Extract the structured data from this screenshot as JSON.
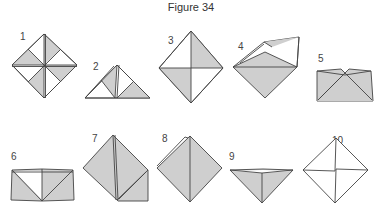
{
  "figure": {
    "title": "Figure 34",
    "step_count": 10,
    "steps": [
      {
        "label": "1",
        "description": "square blank folded into quarters, alternating shaded triangles"
      },
      {
        "label": "2",
        "description": "folded triangle with shaded inner flaps"
      },
      {
        "label": "3",
        "description": "diamond with two shaded quadrants"
      },
      {
        "label": "4",
        "description": "shaded diamond with top flap lifted"
      },
      {
        "label": "5",
        "description": "shaded box shape with pinched top"
      },
      {
        "label": "6",
        "description": "shaded band with white center triangle"
      },
      {
        "label": "7",
        "description": "shaded diamond with square corner flap"
      },
      {
        "label": "8",
        "description": "fully shaded diamond"
      },
      {
        "label": "9",
        "description": "shaded inverted pyramid"
      },
      {
        "label": "10",
        "description": "white diamond with center crease lines"
      }
    ],
    "colors": {
      "shade": "#cfcfcf",
      "paper": "#ffffff",
      "line": "#444444",
      "text": "#333333"
    }
  }
}
